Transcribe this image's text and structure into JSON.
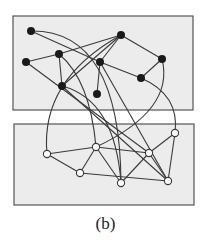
{
  "caption": "(b)",
  "colors": {
    "panel_fill": "#ececec",
    "panel_stroke": "#555555",
    "edge": "#3a3a3a",
    "node_black": "#1a1a1a",
    "node_white": "#ffffff"
  },
  "panels": [
    {
      "id": "top",
      "x": 13,
      "y": 16,
      "w": 180,
      "h": 94
    },
    {
      "id": "bottom",
      "x": 14,
      "y": 124,
      "w": 180,
      "h": 81
    }
  ],
  "nodes": [
    {
      "id": "a1",
      "type": "black",
      "x": 31,
      "y": 31
    },
    {
      "id": "a2",
      "type": "black",
      "x": 121,
      "y": 35
    },
    {
      "id": "a3",
      "type": "black",
      "x": 59,
      "y": 54
    },
    {
      "id": "a4",
      "type": "black",
      "x": 26,
      "y": 62
    },
    {
      "id": "a5",
      "type": "black",
      "x": 100,
      "y": 62
    },
    {
      "id": "a6",
      "type": "black",
      "x": 162,
      "y": 59
    },
    {
      "id": "a7",
      "type": "black",
      "x": 141,
      "y": 78
    },
    {
      "id": "a8",
      "type": "black",
      "x": 62,
      "y": 86
    },
    {
      "id": "a9",
      "type": "black",
      "x": 97,
      "y": 94
    },
    {
      "id": "b1",
      "type": "white",
      "x": 175,
      "y": 133
    },
    {
      "id": "b2",
      "type": "white",
      "x": 96,
      "y": 147
    },
    {
      "id": "b3",
      "type": "white",
      "x": 47,
      "y": 154
    },
    {
      "id": "b4",
      "type": "white",
      "x": 149,
      "y": 153
    },
    {
      "id": "b5",
      "type": "white",
      "x": 80,
      "y": 173
    },
    {
      "id": "b6",
      "type": "white",
      "x": 121,
      "y": 183
    },
    {
      "id": "b7",
      "type": "white",
      "x": 168,
      "y": 181
    }
  ],
  "edges": [
    {
      "from": "a1",
      "to": "a5"
    },
    {
      "from": "a2",
      "to": "a3"
    },
    {
      "from": "a2",
      "to": "a8"
    },
    {
      "from": "a2",
      "to": "a5"
    },
    {
      "from": "a2",
      "to": "a6"
    },
    {
      "from": "a3",
      "to": "a4"
    },
    {
      "from": "a3",
      "to": "a8"
    },
    {
      "from": "a5",
      "to": "a9"
    },
    {
      "from": "a5",
      "to": "a7"
    },
    {
      "from": "a6",
      "to": "a7"
    },
    {
      "from": "a4",
      "to": "b4"
    },
    {
      "from": "a8",
      "to": "b7"
    },
    {
      "from": "a5",
      "to": "b7"
    },
    {
      "from": "b3",
      "to": "b2"
    },
    {
      "from": "b3",
      "to": "b5"
    },
    {
      "from": "b2",
      "to": "b5"
    },
    {
      "from": "b2",
      "to": "b6"
    },
    {
      "from": "b2",
      "to": "b4"
    },
    {
      "from": "b5",
      "to": "b7"
    },
    {
      "from": "b6",
      "to": "b4"
    },
    {
      "from": "b4",
      "to": "b7"
    },
    {
      "from": "b4",
      "to": "b1"
    },
    {
      "from": "b1",
      "to": "b7"
    }
  ],
  "curves": [
    {
      "from": "a1",
      "to": "b6",
      "cx": 120,
      "cy": 30
    },
    {
      "from": "a2",
      "to": "b3",
      "cx": 40,
      "cy": 80
    },
    {
      "from": "a3",
      "to": "b2",
      "cx": 90,
      "cy": 80
    },
    {
      "from": "a6",
      "to": "b2",
      "cx": 175,
      "cy": 110
    },
    {
      "from": "a7",
      "to": "b1",
      "cx": 180,
      "cy": 95
    },
    {
      "from": "a8",
      "to": "b6",
      "cx": 115,
      "cy": 100
    }
  ]
}
